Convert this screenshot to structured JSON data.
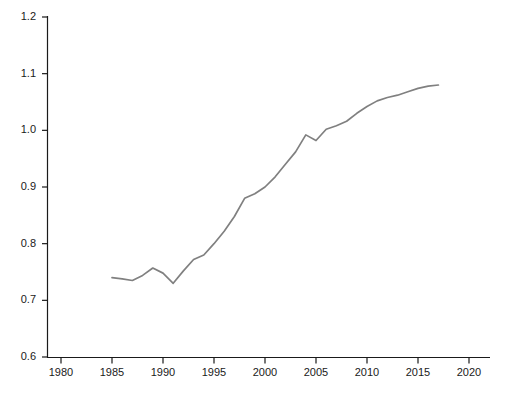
{
  "chart_data": {
    "type": "line",
    "title": "",
    "subtitle": "",
    "xlabel": "",
    "ylabel": "",
    "xlim": [
      1978,
      2022
    ],
    "ylim": [
      0.6,
      1.2
    ],
    "grid": false,
    "legend": null,
    "legend_position": "none",
    "line_color": "#808080",
    "axis_color": "#1a1a1a",
    "x_ticks": [
      1980,
      1985,
      1990,
      1995,
      2000,
      2005,
      2010,
      2015,
      2020
    ],
    "x_tick_labels": [
      "1980",
      "1985",
      "1990",
      "1995",
      "2000",
      "2005",
      "2010",
      "2015",
      "2020"
    ],
    "y_ticks": [
      0.6,
      0.7,
      0.8,
      0.9,
      1.0,
      1.1,
      1.2
    ],
    "y_tick_labels": [
      "0.6",
      "0.7",
      "0.8",
      "0.9",
      "1.0",
      "1.1",
      "1.2"
    ],
    "series": [
      {
        "name": "series-1",
        "color": "#808080",
        "x": [
          1985,
          1986,
          1987,
          1988,
          1989,
          1990,
          1991,
          1992,
          1993,
          1994,
          1995,
          1996,
          1997,
          1998,
          1999,
          2000,
          2001,
          2002,
          2003,
          2004,
          2005,
          2006,
          2007,
          2008,
          2009,
          2010,
          2011,
          2012,
          2013,
          2014,
          2015,
          2016,
          2017
        ],
        "y": [
          0.74,
          0.738,
          0.735,
          0.744,
          0.757,
          0.748,
          0.73,
          0.752,
          0.772,
          0.78,
          0.8,
          0.822,
          0.848,
          0.88,
          0.888,
          0.9,
          0.918,
          0.94,
          0.962,
          0.992,
          0.982,
          1.002,
          1.008,
          1.016,
          1.03,
          1.042,
          1.052,
          1.058,
          1.062,
          1.068,
          1.074,
          1.078,
          1.08
        ]
      }
    ],
    "caption": ""
  },
  "axes": {
    "y_axis_name": "value-axis",
    "x_axis_name": "year-axis"
  }
}
